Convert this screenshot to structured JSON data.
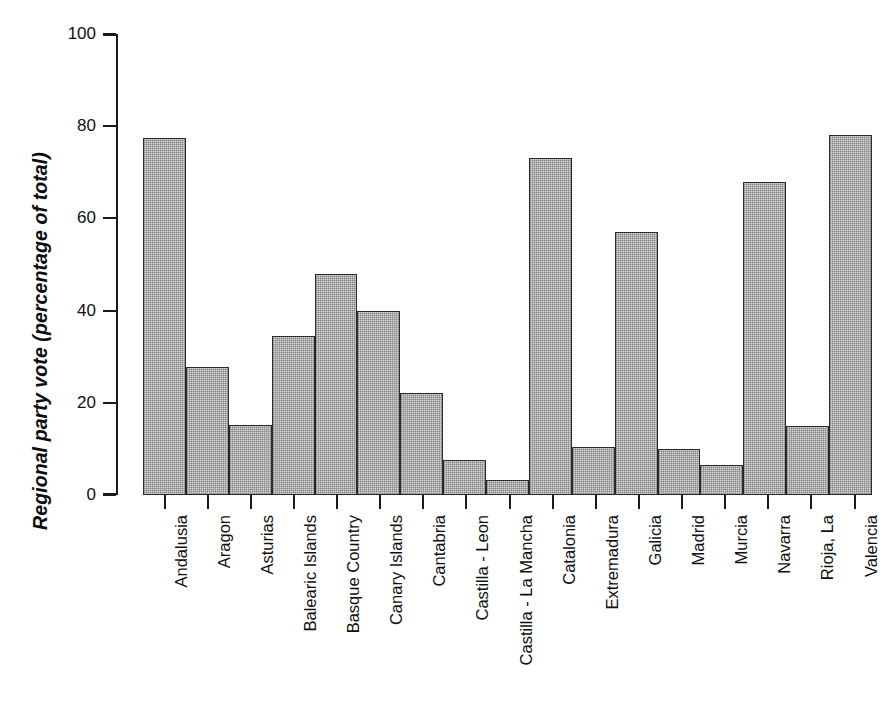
{
  "chart_data": {
    "type": "bar",
    "title": "",
    "xlabel": "",
    "ylabel": "Regional party vote (percentage of  total)",
    "ylim": [
      0,
      100
    ],
    "yticks": [
      0,
      20,
      40,
      60,
      80,
      100
    ],
    "grid": false,
    "legend": null,
    "categories": [
      "Andalusia",
      "Aragon",
      "Asturias",
      "Balearic Islands",
      "Basque Country",
      "Canary Islands",
      "Cantabria",
      "Castilla - Leon",
      "Castilla - La Mancha",
      "Catalonia",
      "Extremadura",
      "Galicia",
      "Madrid",
      "Murcia",
      "Navarra",
      "Rioja, La",
      "Valencia"
    ],
    "values": [
      77.5,
      27.8,
      15.2,
      34.6,
      48.0,
      40.0,
      22.2,
      7.5,
      3.2,
      73.2,
      10.5,
      57.1,
      9.9,
      6.6,
      67.8,
      15.0,
      78.0
    ],
    "bar_style": {
      "fill_color": "#dcdcdc",
      "edge_color": "#2a2a2a",
      "pattern": "fine-stipple"
    }
  },
  "axes": {
    "y_title": "Regional party vote (percentage of  total)",
    "y_tick_labels": [
      "100",
      "80",
      "60",
      "40",
      "20",
      "0"
    ]
  }
}
